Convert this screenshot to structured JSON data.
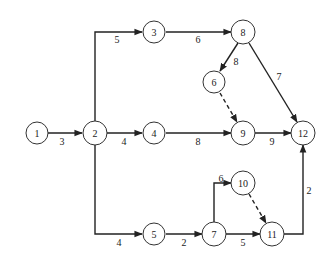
{
  "diagram": {
    "type": "activity-on-arrow network",
    "nodes": [
      {
        "id": "1",
        "label": "1",
        "x": 37,
        "y": 133
      },
      {
        "id": "2",
        "label": "2",
        "x": 95,
        "y": 133
      },
      {
        "id": "3",
        "label": "3",
        "x": 154,
        "y": 32
      },
      {
        "id": "4",
        "label": "4",
        "x": 154,
        "y": 133
      },
      {
        "id": "5",
        "label": "5",
        "x": 154,
        "y": 234
      },
      {
        "id": "6",
        "label": "6",
        "x": 214,
        "y": 82
      },
      {
        "id": "7",
        "label": "7",
        "x": 214,
        "y": 234
      },
      {
        "id": "8",
        "label": "8",
        "x": 243,
        "y": 32
      },
      {
        "id": "9",
        "label": "9",
        "x": 243,
        "y": 133
      },
      {
        "id": "10",
        "label": "10",
        "x": 243,
        "y": 183
      },
      {
        "id": "11",
        "label": "11",
        "x": 272,
        "y": 234
      },
      {
        "id": "12",
        "label": "12",
        "x": 303,
        "y": 133
      }
    ],
    "edges": [
      {
        "from": "1",
        "to": "2",
        "label": "3",
        "dashed": false
      },
      {
        "from": "2",
        "to": "3",
        "label": "5",
        "dashed": false
      },
      {
        "from": "2",
        "to": "4",
        "label": "4",
        "dashed": false
      },
      {
        "from": "2",
        "to": "5",
        "label": "4",
        "dashed": false
      },
      {
        "from": "3",
        "to": "8",
        "label": "6",
        "dashed": false
      },
      {
        "from": "8",
        "to": "6",
        "label": "8",
        "dashed": false
      },
      {
        "from": "8",
        "to": "12",
        "label": "7",
        "dashed": false
      },
      {
        "from": "6",
        "to": "9",
        "label": "",
        "dashed": true
      },
      {
        "from": "4",
        "to": "9",
        "label": "8",
        "dashed": false
      },
      {
        "from": "9",
        "to": "12",
        "label": "9",
        "dashed": false
      },
      {
        "from": "5",
        "to": "7",
        "label": "2",
        "dashed": false
      },
      {
        "from": "7",
        "to": "10",
        "label": "6",
        "dashed": false
      },
      {
        "from": "7",
        "to": "11",
        "label": "5",
        "dashed": false
      },
      {
        "from": "10",
        "to": "11",
        "label": "",
        "dashed": true
      },
      {
        "from": "11",
        "to": "12",
        "label": "2",
        "dashed": false
      }
    ]
  }
}
